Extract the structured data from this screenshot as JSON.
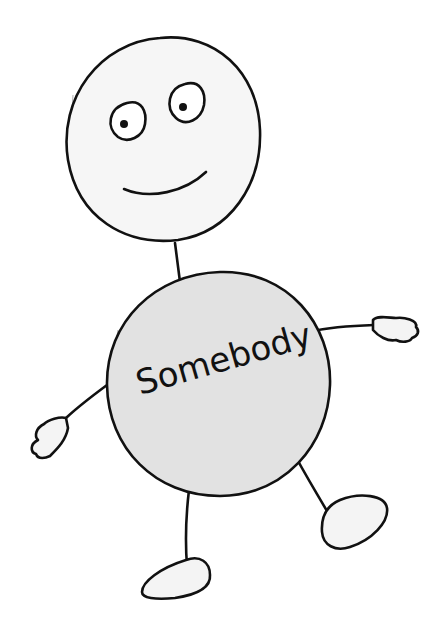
{
  "figure": {
    "label": "Somebody",
    "colors": {
      "background": "#ffffff",
      "ink": "#111111",
      "head_fill": "#f6f6f6",
      "body_fill": "#e2e2e2",
      "limb_fill": "#f4f4f4"
    }
  }
}
